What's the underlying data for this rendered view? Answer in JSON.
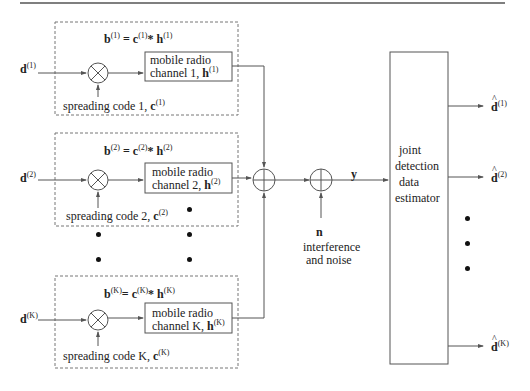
{
  "diagram": {
    "type": "block-diagram",
    "title_rule": true,
    "users": [
      {
        "id": "1",
        "input": "d",
        "input_sup": "(1)",
        "equation": {
          "b": "b",
          "sup_b": "(1)",
          "c": "c",
          "sup_c": "(1)",
          "op": "*",
          "h": "h",
          "sup_h": "(1)"
        },
        "channel_line1": "mobile radio",
        "channel_line2": "channel 1, ",
        "channel_h": "h",
        "channel_h_sup": "(1)",
        "spreading_text": "spreading code 1, ",
        "spreading_c": "c",
        "spreading_c_sup": "(1)"
      },
      {
        "id": "2",
        "input": "d",
        "input_sup": "(2)",
        "equation": {
          "b": "b",
          "sup_b": "(2)",
          "c": "c",
          "sup_c": "(2)",
          "op": "*",
          "h": "h",
          "sup_h": "(2)"
        },
        "channel_line1": "mobile radio",
        "channel_line2": "channel 2, ",
        "channel_h": "h",
        "channel_h_sup": "(2)",
        "spreading_text": "spreading code 2, ",
        "spreading_c": "c",
        "spreading_c_sup": "(2)"
      },
      {
        "id": "K",
        "input": "d",
        "input_sup": "(K)",
        "equation": {
          "b": "b",
          "sup_b": "(K)",
          "c": "c",
          "sup_c": "(K)",
          "op": "*",
          "h": "h",
          "sup_h": "(K)"
        },
        "channel_line1": "mobile radio",
        "channel_line2": "channel K, ",
        "channel_h": "h",
        "channel_h_sup": "(K)",
        "spreading_text": "spreading code K, ",
        "spreading_c": "c",
        "spreading_c_sup": "(K)"
      }
    ],
    "adder_output": "y",
    "noise": {
      "symbol": "n",
      "line1": "interference",
      "line2": "and noise"
    },
    "detector": {
      "line1": "joint",
      "line2": "detection",
      "line3": "data",
      "line4": "estimator"
    },
    "outputs": [
      {
        "symbol": "d",
        "sup": "(1)"
      },
      {
        "symbol": "d",
        "sup": "(2)"
      },
      {
        "symbol": "d",
        "sup": "(K)"
      }
    ],
    "colors": {
      "stroke": "#555555",
      "text": "#222222",
      "dashed": "#777777"
    }
  }
}
